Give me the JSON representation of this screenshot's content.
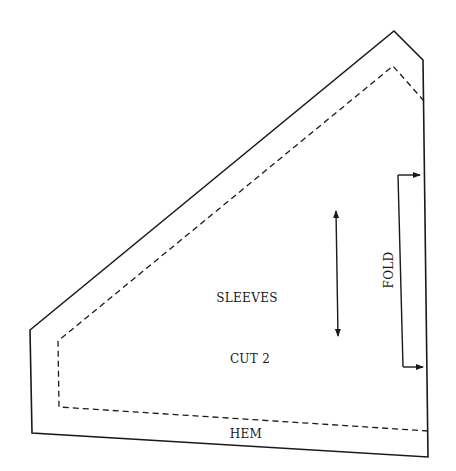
{
  "diagram": {
    "type": "sewing-pattern-piece",
    "piece_name": "SLEEVES",
    "cut_instruction": "CUT 2",
    "fold_label": "FOLD",
    "hem_label": "HEM",
    "colors": {
      "line": "#1a1a1a",
      "background": "#ffffff"
    },
    "outline_points": [
      [
        394,
        31
      ],
      [
        423,
        60
      ],
      [
        428,
        457
      ],
      [
        32,
        433
      ],
      [
        30,
        330
      ]
    ],
    "seam_points": [
      [
        393,
        66
      ],
      [
        424,
        101
      ],
      [
        428,
        431
      ],
      [
        59,
        407
      ],
      [
        58,
        341
      ]
    ],
    "grainline": {
      "from": [
        336,
        209
      ],
      "to": [
        338,
        338
      ],
      "arrows": "both"
    },
    "fold_bracket": {
      "top": [
        398,
        175
      ],
      "bottom": [
        403,
        367
      ],
      "arrow_end_x_top": 420,
      "arrow_end_x_bottom": 423
    }
  }
}
